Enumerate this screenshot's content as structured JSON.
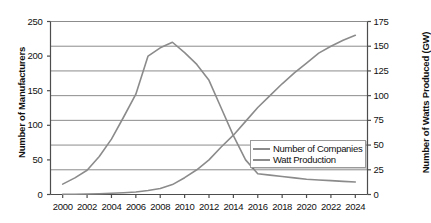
{
  "chart_data": {
    "type": "line",
    "title": "",
    "xlabel": "",
    "ylabel": "Number of Manufacturers",
    "y2label": "Number of Watts Produced (GW)",
    "grid": true,
    "legend_position": "center-right",
    "xlim": [
      1999,
      2025
    ],
    "ylim": [
      0,
      250
    ],
    "y2lim": [
      0,
      175
    ],
    "x_ticks": [
      "2000",
      "2002",
      "2004",
      "2006",
      "2008",
      "2010",
      "2012",
      "2014",
      "2016",
      "2018",
      "2020",
      "2022",
      "2024"
    ],
    "y_ticks_left": [
      "0",
      "50",
      "100",
      "150",
      "200",
      "250"
    ],
    "y_ticks_right": [
      "0",
      "25",
      "50",
      "75",
      "100",
      "125",
      "150",
      "175"
    ],
    "x": [
      2000,
      2001,
      2002,
      2003,
      2004,
      2005,
      2006,
      2007,
      2008,
      2009,
      2010,
      2011,
      2012,
      2013,
      2014,
      2015,
      2016,
      2017,
      2018,
      2019,
      2020,
      2021,
      2022,
      2023,
      2024
    ],
    "series": [
      {
        "name": "Number of Companies",
        "axis": "left",
        "color": "#8b8b8b",
        "values": [
          15,
          24,
          35,
          55,
          80,
          112,
          145,
          200,
          212,
          220,
          205,
          188,
          165,
          125,
          85,
          50,
          30,
          28,
          26,
          24,
          22,
          21,
          20,
          19,
          18
        ]
      },
      {
        "name": "Watt Production",
        "axis": "right",
        "color": "#8b8b8b",
        "values": [
          0.2,
          0.3,
          0.5,
          0.8,
          1.2,
          1.8,
          2.6,
          4,
          6,
          10,
          17,
          25,
          35,
          48,
          60,
          74,
          88,
          100,
          112,
          123,
          133,
          143,
          150,
          156,
          161
        ]
      }
    ],
    "legend": [
      {
        "label": "Number of Companies",
        "color": "#8b8b8b"
      },
      {
        "label": "Watt Production",
        "color": "#8b8b8b"
      }
    ],
    "colors": {
      "axis": "#4d4d4d",
      "grid": "#8c8c8c",
      "line": "#8b8b8b",
      "text": "#111111",
      "background": "#ffffff"
    }
  }
}
